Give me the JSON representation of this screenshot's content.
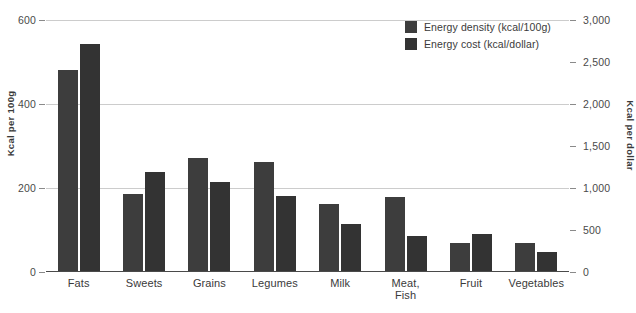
{
  "chart_data": {
    "type": "bar",
    "title": "",
    "subtitle": "",
    "categories": [
      "Fats",
      "Sweets",
      "Grains",
      "Legumes",
      "Milk",
      "Meat,\nFish",
      "Fruit",
      "Vegetables"
    ],
    "series": [
      {
        "name": "Energy density (kcal/100g)",
        "axis": "left",
        "color": "#3d3d3d",
        "values": [
          481,
          186,
          271,
          262,
          162,
          179,
          69,
          69
        ]
      },
      {
        "name": "Energy cost (kcal/dollar)",
        "axis": "right",
        "color": "#333333",
        "values": [
          2715,
          1190,
          1070,
          905,
          570,
          430,
          450,
          240
        ]
      }
    ],
    "left_axis": {
      "label": "Kcal per 100g",
      "ticks": [
        "0",
        "200",
        "400",
        "600"
      ],
      "tick_values": [
        0,
        200,
        400,
        600
      ],
      "min": 0,
      "max": 600
    },
    "right_axis": {
      "label": "Kcal per dollar",
      "ticks": [
        "0",
        "500",
        "1,000",
        "1,500",
        "2,000",
        "2,500",
        "3,000"
      ],
      "tick_values": [
        0,
        500,
        1000,
        1500,
        2000,
        2500,
        3000
      ],
      "min": 0,
      "max": 3000
    },
    "xlabel": "",
    "grid": true,
    "legend_position": "top-right",
    "background_color": "#ffffff",
    "gridline_color": "#cccccc",
    "axis_color": "#4a4a4a"
  },
  "legend": {
    "items": [
      {
        "label": "Energy density (kcal/100g)",
        "color": "#3d3d3d"
      },
      {
        "label": "Energy cost (kcal/dollar)",
        "color": "#333333"
      }
    ]
  }
}
